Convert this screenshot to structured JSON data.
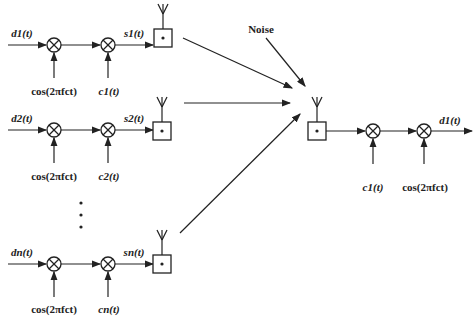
{
  "diagram": {
    "noise_label": "Noise",
    "transmitters": [
      {
        "id": "1",
        "input": "d1(t)",
        "carrier": "cos(2πfct)",
        "code": "c1(t)",
        "output": "s1(t)",
        "y": 45
      },
      {
        "id": "2",
        "input": "d2(t)",
        "carrier": "cos(2πfct)",
        "code": "c2(t)",
        "output": "s2(t)",
        "y": 130
      },
      {
        "id": "n",
        "input": "dn(t)",
        "carrier": "cos(2πfct)",
        "code": "cn(t)",
        "output": "sn(t)",
        "y": 264
      }
    ],
    "ellipsis": "⋮",
    "receiver": {
      "code": "c1(t)",
      "carrier": "cos(2πfct)",
      "output": "d1(t)"
    },
    "colors": {
      "stroke": "#222222",
      "background": "#ffffff"
    }
  }
}
